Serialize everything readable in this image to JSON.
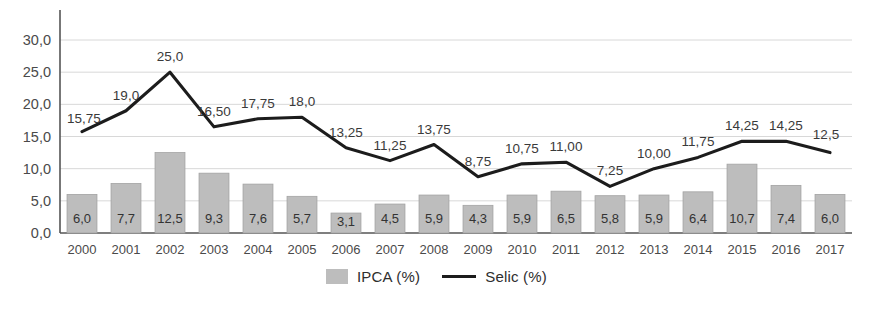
{
  "chart_data": {
    "type": "bar",
    "title": "",
    "subtitle": "",
    "xlabel": "",
    "ylabel": "",
    "ylim": [
      0,
      32.5
    ],
    "yticks": [
      "0,0",
      "5,0",
      "10,0",
      "15,0",
      "20,0",
      "25,0",
      "30,0"
    ],
    "ytick_values": [
      0,
      5,
      10,
      15,
      20,
      25,
      30
    ],
    "grid": true,
    "legend_position": "bottom",
    "categories": [
      "2000",
      "2001",
      "2002",
      "2003",
      "2004",
      "2005",
      "2006",
      "2007",
      "2008",
      "2009",
      "2010",
      "2011",
      "2012",
      "2013",
      "2014",
      "2015",
      "2016",
      "2017"
    ],
    "series": [
      {
        "name": "IPCA (%)",
        "type": "bar",
        "color": "#bdbdbd",
        "values": [
          6.0,
          7.7,
          12.5,
          9.3,
          7.6,
          5.7,
          3.1,
          4.5,
          5.9,
          4.3,
          5.9,
          6.5,
          5.8,
          5.9,
          6.4,
          10.7,
          7.4,
          6.0
        ],
        "labels": [
          "6,0",
          "7,7",
          "12,5",
          "9,3",
          "7,6",
          "5,7",
          "3,1",
          "4,5",
          "5,9",
          "4,3",
          "5,9",
          "6,5",
          "5,8",
          "5,9",
          "6,4",
          "10,7",
          "7,4",
          "6,0"
        ]
      },
      {
        "name": "Selic (%)",
        "type": "line",
        "color": "#1c1c1c",
        "values": [
          15.75,
          19.0,
          25.0,
          16.5,
          17.75,
          18.0,
          13.25,
          11.25,
          13.75,
          8.75,
          10.75,
          11.0,
          7.25,
          10.0,
          11.75,
          14.25,
          14.25,
          12.5
        ],
        "labels": [
          "15,75",
          "19,0",
          "25,0",
          "16,50",
          "17,75",
          "18,0",
          "13,25",
          "11,25",
          "13,75",
          "8,75",
          "10,75",
          "11,00",
          "7,25",
          "10,00",
          "11,75",
          "14,25",
          "14,25",
          "12,5"
        ]
      }
    ]
  },
  "legend": {
    "items": [
      {
        "label": "IPCA (%)",
        "marker": "bar-swatch"
      },
      {
        "label": "Selic (%)",
        "marker": "line-swatch"
      }
    ]
  },
  "colors": {
    "bar_fill": "#bdbdbd",
    "bar_stroke": "#a3a3a3",
    "line": "#1c1c1c",
    "axis": "#555555",
    "grid": "#d8d8d8",
    "text": "#3a3a3a",
    "background": "#ffffff"
  }
}
